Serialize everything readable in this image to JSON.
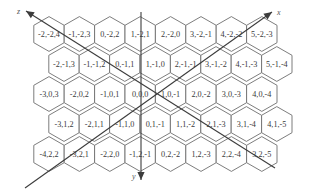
{
  "diagram": {
    "hex_size": {
      "width": 30.4,
      "row_spacing": 30
    },
    "rows": [
      {
        "row": 0,
        "y": 34,
        "x_start": 49,
        "cells": [
          "-2,-2,4",
          "-1,-2,3",
          "0,-2,2",
          "1,-2,1",
          "2,-2,0",
          "3,-2,-1",
          "4,-2,-2",
          "5,-2,-3"
        ]
      },
      {
        "row": 1,
        "y": 64,
        "x_start": 64,
        "cells": [
          "-2,-1,3",
          "-1,-1,2",
          "0,-1,1",
          "1,-1,0",
          "2,-1,-1",
          "3,-1,-2",
          "4,-1,-3",
          "5,-1,-4"
        ]
      },
      {
        "row": 2,
        "y": 94,
        "x_start": 49,
        "cells": [
          "-3,0,3",
          "-2,0,2",
          "-1,0,1",
          "0,0,0",
          "1,0,-1",
          "2,0,-2",
          "3,0,-3",
          "4,0,-4"
        ]
      },
      {
        "row": 3,
        "y": 124,
        "x_start": 64,
        "cells": [
          "-3,1,2",
          "-2,1,1",
          "-1,1,0",
          "0,1,-1",
          "1,1,-2",
          "2,1,-3",
          "3,1,-4",
          "4,1,-5"
        ]
      },
      {
        "row": 4,
        "y": 154,
        "x_start": 49,
        "cells": [
          "-4,2,2",
          "-3,2,1",
          "-2,2,0",
          "-1,2,-1",
          "0,2,-2",
          "1,2,-3",
          "2,2,-4",
          "3,2,-5"
        ]
      }
    ],
    "axes": {
      "x": {
        "label": "x",
        "from": [
          25,
          188
        ],
        "to": [
          272,
          12
        ]
      },
      "y": {
        "label": "y",
        "from": [
          141,
          12
        ],
        "to": [
          141,
          180
        ]
      },
      "z": {
        "label": "z",
        "from": [
          275,
          168
        ],
        "to": [
          26,
          11
        ]
      }
    },
    "colors": {
      "hex_stroke": "#6e6e6e",
      "axis": "#3c3c3c",
      "text": "#3a3a3a",
      "background": "#ffffff"
    }
  }
}
